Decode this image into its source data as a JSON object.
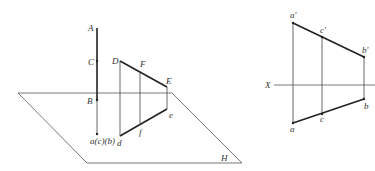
{
  "left_figure": {
    "plane_label": "H",
    "points": {
      "A": "A",
      "C": "C",
      "B": "B",
      "proj_acb": "a(c)(b)",
      "D": "D",
      "F": "F",
      "E": "E",
      "e": "e",
      "f": "f",
      "d": "d"
    }
  },
  "right_figure": {
    "axis_label": "X",
    "points": {
      "a_prime": "a'",
      "c_prime": "c'",
      "b_prime": "b'",
      "a": "a",
      "c": "c",
      "b": "b"
    }
  },
  "colors": {
    "line": "#333333",
    "thin": "#555555",
    "background": "#ffffff"
  }
}
